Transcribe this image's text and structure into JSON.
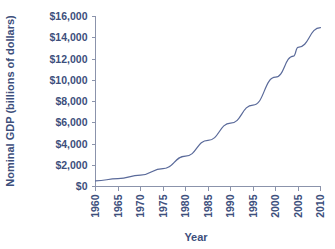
{
  "chart_data": {
    "type": "line",
    "title": "",
    "xlabel": "Year",
    "ylabel": "Nominal GDP (billions of dollars)",
    "x": [
      1960,
      1965,
      1970,
      1975,
      1980,
      1985,
      1990,
      1995,
      2000,
      2004,
      2005,
      2010
    ],
    "values": [
      526,
      743,
      1076,
      1689,
      2862,
      4347,
      5963,
      7664,
      10285,
      12275,
      13094,
      14958
    ],
    "series": [
      {
        "name": "Nominal GDP",
        "values": [
          526,
          743,
          1076,
          1689,
          2862,
          4347,
          5963,
          7664,
          10285,
          12275,
          13094,
          14958
        ]
      }
    ],
    "xlim": [
      1960,
      2010
    ],
    "ylim": [
      0,
      16000
    ],
    "xticks": [
      1960,
      1965,
      1970,
      1975,
      1980,
      1985,
      1990,
      1995,
      2000,
      2005,
      2010
    ],
    "yticks": [
      0,
      2000,
      4000,
      6000,
      8000,
      10000,
      12000,
      14000,
      16000
    ],
    "xtick_labels": [
      "1960",
      "1965",
      "1970",
      "1975",
      "1980",
      "1985",
      "1990",
      "1995",
      "2000",
      "2005",
      "2010"
    ],
    "ytick_labels": [
      "$0",
      "$2,000",
      "$4,000",
      "$6,000",
      "$8,000",
      "$10,000",
      "$12,000",
      "$14,000",
      "$16,000"
    ],
    "grid": false,
    "legend": false,
    "legend_position": "none",
    "line_color": "#5a6a9a",
    "text_color": "#3d4f7c",
    "axis_color": "#8b93ab",
    "background_color": "#ffffff",
    "xtick_label_rotation": -90,
    "ytick_label_rotation": 0,
    "ylabel_rotation": -90
  }
}
